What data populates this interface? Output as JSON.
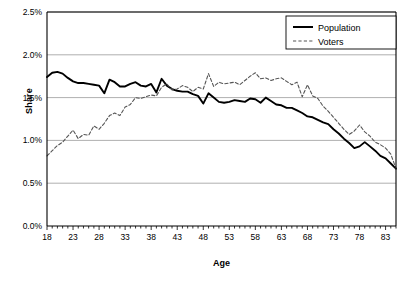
{
  "chart_data": {
    "type": "line",
    "title": "",
    "xlabel": "Age",
    "ylabel": "Share",
    "xlim": [
      18,
      85
    ],
    "ylim": [
      0,
      0.025
    ],
    "grid": "horizontal",
    "legend_position": "top-right",
    "ytick_labels": [
      "0.0%",
      "0.5%",
      "1.0%",
      "1.5%",
      "2.0%",
      "2.5%"
    ],
    "ytick_values": [
      0.0,
      0.005,
      0.01,
      0.015,
      0.02,
      0.025
    ],
    "xtick_labels": [
      "18",
      "23",
      "28",
      "33",
      "38",
      "43",
      "48",
      "53",
      "58",
      "63",
      "68",
      "73",
      "78",
      "83"
    ],
    "xtick_values": [
      18,
      23,
      28,
      33,
      38,
      43,
      48,
      53,
      58,
      63,
      68,
      73,
      78,
      83
    ],
    "x": [
      18,
      19,
      20,
      21,
      22,
      23,
      24,
      25,
      26,
      27,
      28,
      29,
      30,
      31,
      32,
      33,
      34,
      35,
      36,
      37,
      38,
      39,
      40,
      41,
      42,
      43,
      44,
      45,
      46,
      47,
      48,
      49,
      50,
      51,
      52,
      53,
      54,
      55,
      56,
      57,
      58,
      59,
      60,
      61,
      62,
      63,
      64,
      65,
      66,
      67,
      68,
      69,
      70,
      71,
      72,
      73,
      74,
      75,
      76,
      77,
      78,
      79,
      80,
      81,
      82,
      83,
      84,
      85
    ],
    "series": [
      {
        "name": "Population",
        "style": "solid",
        "color": "#000000",
        "values": [
          1.74,
          1.79,
          1.8,
          1.78,
          1.73,
          1.69,
          1.67,
          1.67,
          1.66,
          1.65,
          1.64,
          1.55,
          1.71,
          1.68,
          1.63,
          1.63,
          1.66,
          1.68,
          1.64,
          1.63,
          1.66,
          1.56,
          1.72,
          1.64,
          1.6,
          1.58,
          1.57,
          1.57,
          1.54,
          1.52,
          1.43,
          1.55,
          1.5,
          1.45,
          1.44,
          1.45,
          1.47,
          1.46,
          1.45,
          1.49,
          1.48,
          1.44,
          1.5,
          1.46,
          1.42,
          1.41,
          1.38,
          1.38,
          1.35,
          1.32,
          1.28,
          1.27,
          1.24,
          1.21,
          1.19,
          1.13,
          1.08,
          1.02,
          0.97,
          0.91,
          0.93,
          0.98,
          0.93,
          0.88,
          0.82,
          0.79,
          0.73,
          0.67
        ]
      },
      {
        "name": "Voters",
        "style": "dashed",
        "color": "#555555",
        "values": [
          0.82,
          0.88,
          0.94,
          0.98,
          1.05,
          1.12,
          1.02,
          1.07,
          1.06,
          1.17,
          1.13,
          1.2,
          1.29,
          1.32,
          1.29,
          1.39,
          1.42,
          1.5,
          1.49,
          1.51,
          1.53,
          1.52,
          1.62,
          1.66,
          1.59,
          1.6,
          1.64,
          1.62,
          1.57,
          1.62,
          1.6,
          1.78,
          1.63,
          1.68,
          1.66,
          1.67,
          1.68,
          1.65,
          1.7,
          1.75,
          1.79,
          1.72,
          1.73,
          1.7,
          1.72,
          1.73,
          1.69,
          1.65,
          1.68,
          1.51,
          1.65,
          1.52,
          1.49,
          1.4,
          1.34,
          1.27,
          1.2,
          1.13,
          1.07,
          1.11,
          1.18,
          1.1,
          1.05,
          0.98,
          0.95,
          0.91,
          0.84,
          0.67
        ]
      }
    ]
  },
  "legend": {
    "items": [
      {
        "label": "Population",
        "style": "solid"
      },
      {
        "label": "Voters",
        "style": "dashed"
      }
    ]
  }
}
